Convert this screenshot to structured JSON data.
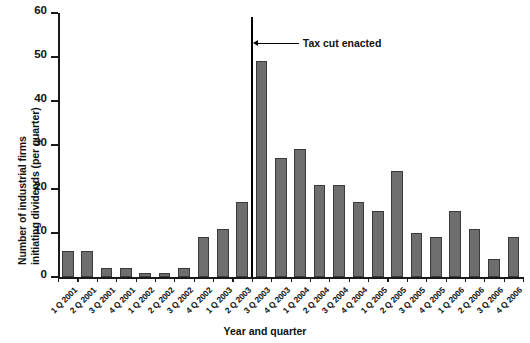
{
  "chart_data": {
    "type": "bar",
    "title": "",
    "xlabel": "Year and quarter",
    "ylabel_line1": "Number of industrial firms",
    "ylabel_line2": "initiating dividends (per quarter)",
    "categories": [
      "1 Q 2001",
      "2 Q 2001",
      "3 Q 2001",
      "4 Q 2001",
      "1 Q 2002",
      "2 Q 2002",
      "3 Q 2002",
      "4 Q 2002",
      "1 Q 2003",
      "2 Q 2003",
      "3 Q 2003",
      "4 Q 2003",
      "1 Q 2004",
      "2 Q 2004",
      "3 Q 2004",
      "4 Q 2004",
      "1 Q 2005",
      "2 Q 2005",
      "3 Q 2005",
      "4 Q 2005",
      "1 Q 2006",
      "2 Q 2006",
      "3 Q 2006",
      "4 Q 2006"
    ],
    "values": [
      6,
      6,
      2,
      2,
      1,
      1,
      2,
      9,
      11,
      17,
      49,
      27,
      29,
      21,
      21,
      17,
      15,
      24,
      10,
      9,
      15,
      11,
      4,
      9
    ],
    "ylim": [
      0,
      60
    ],
    "yticks": [
      0,
      10,
      20,
      30,
      40,
      50,
      60
    ],
    "grid": false,
    "legend": "none",
    "bar_color": "#6e6e6e",
    "bar_edge_color": "#3a3a3a",
    "annotations": [
      {
        "label": "Tax cut enacted",
        "at_category_boundary": "between 2 Q 2003 and 3 Q 2003",
        "line_color": "#000000",
        "line_top_value": 59,
        "label_value": 53
      }
    ]
  }
}
